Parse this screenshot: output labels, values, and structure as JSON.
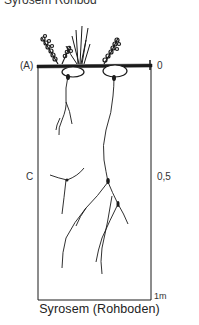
{
  "figure": {
    "top_text_fragment": "Syrosem (Rohboden)",
    "horizon_labels": [
      {
        "id": "A",
        "text": "(A)"
      },
      {
        "id": "C",
        "text": "C"
      }
    ],
    "depth_scale": [
      {
        "text": "0"
      },
      {
        "text": "0,5"
      },
      {
        "text": "1m"
      }
    ],
    "caption": "Syrosem (Rohboden)"
  },
  "colors": {
    "ink": "#1a1a1a",
    "background": "#ffffff"
  }
}
